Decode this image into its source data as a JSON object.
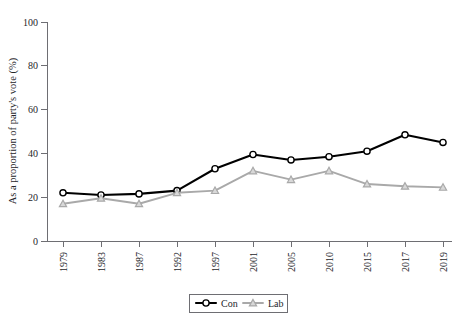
{
  "chart_data": {
    "type": "line",
    "title": "",
    "xlabel": "",
    "ylabel": "As a proportion of party's vote (%)",
    "categories": [
      "1979",
      "1983",
      "1987",
      "1992",
      "1997",
      "2001",
      "2005",
      "2010",
      "2015",
      "2017",
      "2019"
    ],
    "series": [
      {
        "name": "Con",
        "color": "#000000",
        "marker": "circle",
        "values": [
          22,
          21,
          21.5,
          23,
          33,
          39.5,
          37,
          38.5,
          41,
          48.5,
          45
        ]
      },
      {
        "name": "Lab",
        "color": "#a9a9a9",
        "marker": "triangle",
        "values": [
          17,
          19.5,
          17,
          22,
          23,
          32,
          28,
          32,
          26,
          25,
          24.5
        ]
      }
    ],
    "ylim": [
      0,
      100
    ],
    "yticks": [
      0,
      20,
      40,
      60,
      80,
      100
    ],
    "ytick_labels": [
      "0",
      "20",
      "40",
      "60",
      "80",
      "100"
    ],
    "grid": false,
    "legend_position": "bottom-center",
    "legend_entries": [
      "Con",
      "Lab"
    ]
  }
}
